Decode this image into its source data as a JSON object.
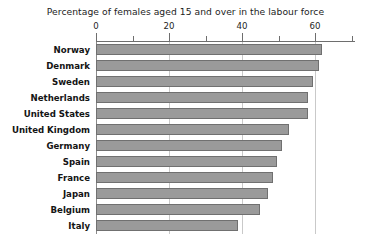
{
  "chart_data": {
    "type": "bar",
    "orientation": "horizontal",
    "title": "Percentage of females aged 15 and over in the labour force",
    "xlabel": "",
    "ylabel": "",
    "xlim": [
      0,
      71
    ],
    "grid": true,
    "legend": "none",
    "bar_color": "#9a9a9a",
    "bar_border_color": "#707070",
    "axis_color": "#6e6e6e",
    "gridline_color": "#c9c9c9",
    "tick_labels": [
      "0",
      "20",
      "40",
      "60"
    ],
    "tick_values": [
      0,
      20,
      40,
      60
    ],
    "minor_tick_values": [
      10,
      30,
      50,
      70
    ],
    "categories": [
      "Norway",
      "Denmark",
      "Sweden",
      "Netherlands",
      "United States",
      "United Kingdom",
      "Germany",
      "Spain",
      "France",
      "Japan",
      "Belgium",
      "Italy"
    ],
    "values": [
      62,
      61,
      59.5,
      58,
      58,
      53,
      51,
      49.5,
      48.5,
      47,
      45,
      39
    ]
  }
}
